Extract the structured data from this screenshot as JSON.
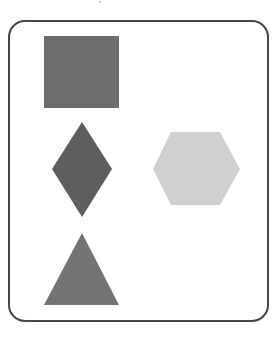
{
  "figure": {
    "background": "#ffffff",
    "frame": {
      "stroke": "#454545",
      "fill": "#ffffff",
      "corner_radius": 16
    },
    "shapes": [
      {
        "type": "square",
        "color": "#6e6e6e",
        "position": "top-left"
      },
      {
        "type": "diamond",
        "color": "#5e5e5e",
        "position": "middle-left"
      },
      {
        "type": "hexagon",
        "color": "#d0d0d0",
        "position": "middle-right"
      },
      {
        "type": "triangle",
        "color": "#737373",
        "position": "bottom-left"
      }
    ]
  }
}
